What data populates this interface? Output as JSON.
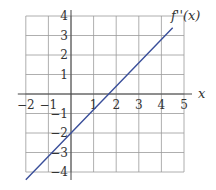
{
  "chart_data": {
    "type": "line",
    "title": "",
    "xlabel": "x",
    "ylabel": "",
    "xlim": [
      -2,
      5
    ],
    "ylim": [
      -4,
      4
    ],
    "grid": true,
    "x_ticks": [
      -2,
      -1,
      1,
      2,
      3,
      4,
      5
    ],
    "y_ticks": [
      4,
      3,
      2,
      1,
      -1,
      -2,
      -3,
      -4
    ],
    "x_tick_labels": [
      "−2",
      "−1",
      "1",
      "2",
      "3",
      "4",
      "5"
    ],
    "y_tick_labels": [
      "4",
      "3",
      "2",
      "1",
      "−1",
      "−2",
      "−3",
      "−4"
    ],
    "series": [
      {
        "name": "f''(x)",
        "color": "#3a4f9a",
        "x": [
          -2.0,
          0,
          1.67,
          4.5
        ],
        "y": [
          -4.4,
          -2.0,
          0,
          3.4
        ]
      }
    ],
    "annotations": [
      {
        "text": "f''(x)",
        "x": 4.7,
        "y": 3.9
      }
    ]
  },
  "labels": {
    "x_axis": "x",
    "curve": "f''(x)"
  }
}
